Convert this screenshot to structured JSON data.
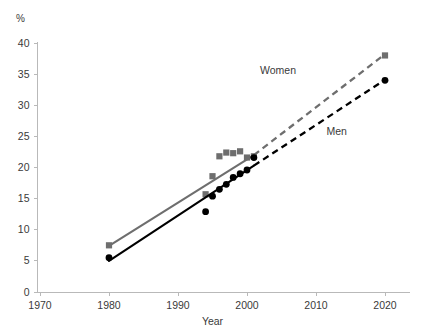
{
  "chart_data": {
    "type": "scatter",
    "title": "",
    "subtitle": "",
    "xlabel": "Year",
    "ylabel": "%",
    "unit_label": "%",
    "xlim": [
      1970,
      2025
    ],
    "ylim": [
      0,
      41
    ],
    "xticks": [
      1970,
      1980,
      1990,
      2000,
      2010,
      2020
    ],
    "xtick_labels": [
      "1970",
      "1980",
      "1990",
      "2000",
      "2010",
      "2020"
    ],
    "yticks": [
      0,
      5,
      10,
      15,
      20,
      25,
      30,
      35,
      40
    ],
    "ytick_labels": [
      "0",
      "5",
      "10",
      "15",
      "20",
      "25",
      "30",
      "35",
      "40"
    ],
    "grid": false,
    "legend_position": "inline-annotation",
    "series": [
      {
        "name": "Women",
        "color": "#6e6e6e",
        "marker": "square",
        "label_text": "Women",
        "points": [
          {
            "x": 1980,
            "y": 7.5
          },
          {
            "x": 1994,
            "y": 15.7
          },
          {
            "x": 1995,
            "y": 18.6
          },
          {
            "x": 1996,
            "y": 21.8
          },
          {
            "x": 1997,
            "y": 22.4
          },
          {
            "x": 1998,
            "y": 22.3
          },
          {
            "x": 1999,
            "y": 22.6
          },
          {
            "x": 2000,
            "y": 21.6
          },
          {
            "x": 2001,
            "y": 21.8
          },
          {
            "x": 2020,
            "y": 38.0
          }
        ],
        "fit_solid": {
          "x0": 1980,
          "y0": 7.4,
          "x1": 2001,
          "y1": 22.0
        },
        "fit_dashed": {
          "x0": 2001,
          "y0": 22.0,
          "x1": 2020,
          "y1": 38.2
        }
      },
      {
        "name": "Men",
        "color": "#000000",
        "marker": "circle",
        "label_text": "Men",
        "points": [
          {
            "x": 1980,
            "y": 5.5
          },
          {
            "x": 1994,
            "y": 12.9
          },
          {
            "x": 1995,
            "y": 15.4
          },
          {
            "x": 1996,
            "y": 16.5
          },
          {
            "x": 1997,
            "y": 17.3
          },
          {
            "x": 1998,
            "y": 18.4
          },
          {
            "x": 1999,
            "y": 19.0
          },
          {
            "x": 2000,
            "y": 19.6
          },
          {
            "x": 2001,
            "y": 21.6
          },
          {
            "x": 2020,
            "y": 34.0
          }
        ],
        "fit_solid": {
          "x0": 1980,
          "y0": 5.0,
          "x1": 2001,
          "y1": 20.3
        },
        "fit_dashed": {
          "x0": 2001,
          "y0": 20.3,
          "x1": 2020,
          "y1": 34.1
        }
      }
    ],
    "annotations": [
      {
        "text": "Women",
        "x": 2004.5,
        "y": 35.0
      },
      {
        "text": "Men",
        "x": 2013.0,
        "y": 25.3
      }
    ]
  },
  "axis": {
    "x_title": "Year",
    "y_unit": "%"
  }
}
